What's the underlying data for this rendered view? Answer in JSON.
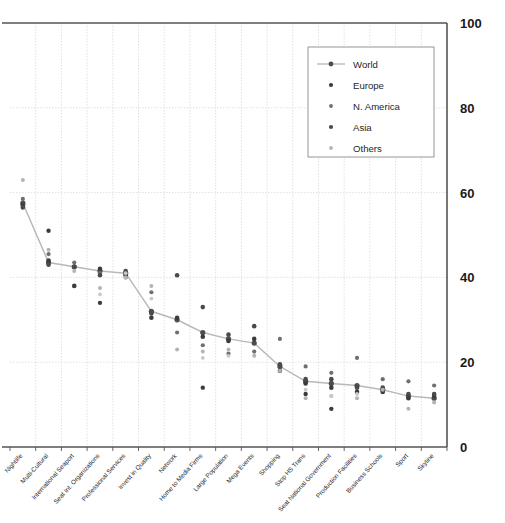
{
  "chart_data": {
    "type": "scatter",
    "title": "",
    "xlabel": "",
    "ylabel": "",
    "ylim": [
      0,
      100
    ],
    "yticks": [
      0,
      20,
      40,
      60,
      80,
      100
    ],
    "grid": true,
    "legend_position": "top-right",
    "categories": [
      "Nightlife",
      "Multi-Cultural",
      "International Seaport",
      "Seat Int. Organizations",
      "Professional Services",
      "Invest in Quality",
      "Network",
      "Home to Media Firms",
      "Large Population",
      "Mega Events",
      "Shopping",
      "Stop HS Trans",
      "Seat National Government",
      "Production Facilities",
      "Business Schools",
      "Sport",
      "Skyline"
    ],
    "series": [
      {
        "name": "World",
        "kind": "line",
        "color": "#5a5a5a",
        "values": [
          57.5,
          43.5,
          42.5,
          41.5,
          41.0,
          32.0,
          30.0,
          27.0,
          25.5,
          24.5,
          19.0,
          15.5,
          15.0,
          14.5,
          13.5,
          12.0,
          11.5
        ]
      },
      {
        "name": "Europe",
        "kind": "points",
        "color": "#3c3c3c",
        "values": [
          57.0,
          44.0,
          38.0,
          42.0,
          40.5,
          30.5,
          30.5,
          26.0,
          25.0,
          25.5,
          18.0,
          15.0,
          14.0,
          13.0,
          13.0,
          11.5,
          12.0
        ]
      },
      {
        "name": "N. America",
        "kind": "points",
        "color": "#6f6f6f",
        "values": [
          58.5,
          45.5,
          43.5,
          41.0,
          40.0,
          36.5,
          27.0,
          24.0,
          22.0,
          22.5,
          25.5,
          19.0,
          17.5,
          21.0,
          16.0,
          15.5,
          14.5
        ]
      },
      {
        "name": "Asia",
        "kind": "points",
        "color": "#4a4a4a",
        "values": [
          56.5,
          43.0,
          42.5,
          40.5,
          41.5,
          31.5,
          40.5,
          33.0,
          26.5,
          28.5,
          19.5,
          16.0,
          16.0,
          14.0,
          14.0,
          12.5,
          12.5
        ]
      },
      {
        "name": "Others",
        "kind": "points",
        "color": "#b4b4b4",
        "values": [
          63.0,
          46.5,
          41.5,
          37.5,
          40.0,
          38.0,
          23.0,
          22.5,
          23.0,
          21.5,
          18.0,
          11.5,
          12.0,
          11.5,
          13.5,
          9.0,
          10.5
        ]
      },
      {
        "name": "Europe-extra",
        "kind": "points",
        "color": "#3c3c3c",
        "values": [
          null,
          51.0,
          null,
          34.0,
          null,
          null,
          null,
          14.0,
          null,
          null,
          null,
          12.5,
          9.0,
          null,
          null,
          null,
          null
        ]
      },
      {
        "name": "Others-extra",
        "kind": "points",
        "color": "#c8c8c8",
        "values": [
          null,
          null,
          null,
          36.0,
          41.0,
          35.0,
          null,
          21.0,
          21.5,
          null,
          null,
          13.5,
          12.0,
          12.5,
          null,
          null,
          null
        ]
      }
    ]
  },
  "legend": {
    "entries": [
      {
        "label": "World",
        "marker": "line-dot"
      },
      {
        "label": "Europe",
        "marker": "dot-dark"
      },
      {
        "label": "N. America",
        "marker": "dot-mid"
      },
      {
        "label": "Asia",
        "marker": "dot-dark2"
      },
      {
        "label": "Others",
        "marker": "dot-light"
      }
    ]
  },
  "axis": {
    "y_tick_labels": [
      "100",
      "80",
      "60",
      "40",
      "20",
      "0"
    ]
  },
  "colors": {
    "world_line": "#b9b9b9",
    "world_marker": "#4d4d4d",
    "europe": "#3c3c3c",
    "n_america": "#6f6f6f",
    "asia": "#4a4a4a",
    "others": "#b4b4b4",
    "grid": "#d9d9d9",
    "axis": "#555555",
    "legend_border": "#8a8a8a"
  }
}
